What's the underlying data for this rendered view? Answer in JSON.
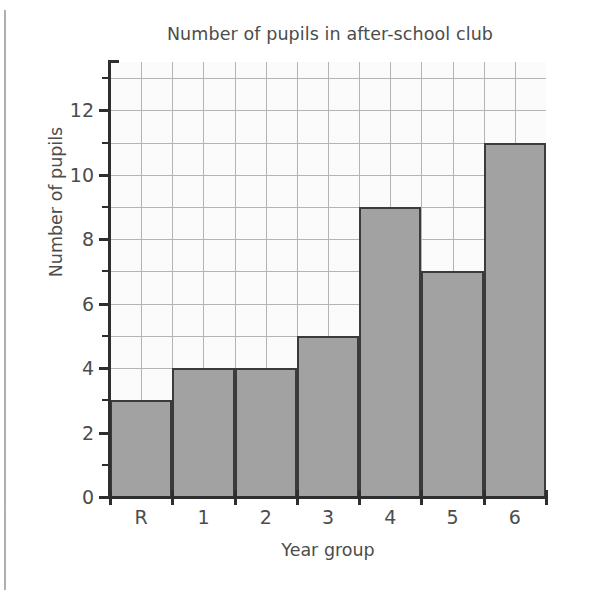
{
  "chart_data": {
    "type": "bar",
    "title": "Number of pupils in after-school club",
    "xlabel": "Year group",
    "ylabel": "Number of pupils",
    "categories": [
      "R",
      "1",
      "2",
      "3",
      "4",
      "5",
      "6"
    ],
    "values": [
      3,
      4,
      4,
      5,
      9,
      7,
      11
    ],
    "ylim": [
      0,
      13.5
    ],
    "ytick_labels": [
      "0",
      "2",
      "4",
      "6",
      "8",
      "10",
      "12"
    ],
    "ytick_values": [
      0,
      2,
      4,
      6,
      8,
      10,
      12
    ],
    "y_minor_ticks": [
      1,
      3,
      5,
      7,
      9,
      11,
      13
    ],
    "grid": "both",
    "grid_h_step": 1,
    "grid_v_divisions_per_bar": 2,
    "legend": "none",
    "bar_fill_color": "#a2a2a2",
    "bar_edge_color": "#3b3b3b",
    "grid_color": "#b4b4b4",
    "axis_color": "#2e2e2e",
    "plot_background": "#fbfbfb",
    "series": [
      {
        "name": "Number of pupils",
        "values": [
          3,
          4,
          4,
          5,
          9,
          7,
          11
        ]
      }
    ],
    "points": [
      {
        "category": "R",
        "value": 3
      },
      {
        "category": "1",
        "value": 4
      },
      {
        "category": "2",
        "value": 4
      },
      {
        "category": "3",
        "value": 5
      },
      {
        "category": "4",
        "value": 9
      },
      {
        "category": "5",
        "value": 7
      },
      {
        "category": "6",
        "value": 11
      }
    ]
  }
}
